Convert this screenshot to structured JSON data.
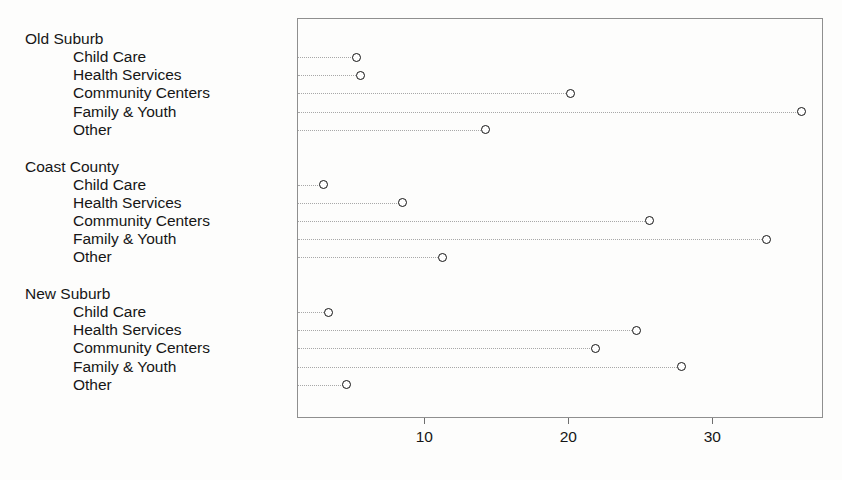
{
  "chart_data": {
    "type": "scatter",
    "plot_style": "cleveland-dot-plot",
    "title": "",
    "subtitle": "",
    "xlabel": "",
    "ylabel": "",
    "xlim": [
      0,
      38.3
    ],
    "ylim": [
      0,
      15
    ],
    "grid": false,
    "legend": null,
    "marker": "open-circle",
    "leader_lines": "dotted",
    "xticks": [
      10,
      20,
      30
    ],
    "xtick_labels": [
      "10",
      "20",
      "30"
    ],
    "categories": [
      "Child Care",
      "Health Services",
      "Community Centers",
      "Family & Youth",
      "Other"
    ],
    "groups": [
      {
        "name": "Old Suburb",
        "points": [
          {
            "label": "Child Care",
            "value": 5.2
          },
          {
            "label": "Health Services",
            "value": 5.5
          },
          {
            "label": "Community Centers",
            "value": 20.1
          },
          {
            "label": "Family & Youth",
            "value": 36.1
          },
          {
            "label": "Other",
            "value": 14.2
          }
        ]
      },
      {
        "name": "Coast County",
        "points": [
          {
            "label": "Child Care",
            "value": 2.9
          },
          {
            "label": "Health Services",
            "value": 8.4
          },
          {
            "label": "Community Centers",
            "value": 25.6
          },
          {
            "label": "Family & Youth",
            "value": 33.7
          },
          {
            "label": "Other",
            "value": 11.2
          }
        ]
      },
      {
        "name": "New Suburb",
        "points": [
          {
            "label": "Child Care",
            "value": 3.3
          },
          {
            "label": "Health Services",
            "value": 24.7
          },
          {
            "label": "Community Centers",
            "value": 21.8
          },
          {
            "label": "Family & Youth",
            "value": 27.8
          },
          {
            "label": "Other",
            "value": 4.5
          }
        ]
      }
    ]
  }
}
